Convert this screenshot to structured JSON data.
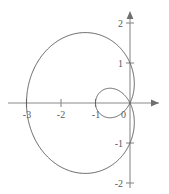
{
  "chart_data": {
    "type": "line",
    "title": "",
    "subtitle": "",
    "xlabel": "",
    "ylabel": "",
    "grid": false,
    "legend": null,
    "axis_style": "arrow-axes-through-origin",
    "xlim": [
      -3.2,
      1.0
    ],
    "ylim": [
      -2.3,
      2.3
    ],
    "xticks": [
      -3,
      -2,
      -1
    ],
    "yticks": [
      2,
      1,
      -1,
      -2
    ],
    "origin_label": "0",
    "xtick_labels": [
      "-3",
      "-2",
      "-1"
    ],
    "ytick_labels": [
      "2",
      "1",
      "-1",
      "-2"
    ],
    "curve": {
      "name": "limacon",
      "equation": "r = 1 - 2 cos(theta)",
      "closed": true,
      "has_inner_loop": true,
      "outer_loop_extent_x": [
        -3.0,
        0.0
      ],
      "outer_loop_extent_y": [
        -1.65,
        1.65
      ],
      "inner_loop_extent_x": [
        -1.0,
        0.0
      ],
      "inner_loop_extent_y": [
        -0.42,
        0.42
      ],
      "points": [
        [
          0.0,
          0.0
        ],
        [
          -0.105,
          0.196
        ],
        [
          -0.378,
          0.345
        ],
        [
          -0.75,
          0.433
        ],
        [
          -1.155,
          0.44
        ],
        [
          -1.55,
          0.36
        ],
        [
          -1.9,
          0.2
        ],
        [
          -2.2,
          -0.02
        ],
        [
          -2.45,
          -0.28
        ],
        [
          -2.64,
          -0.56
        ],
        [
          -2.8,
          -0.86
        ],
        [
          -2.91,
          -1.16
        ],
        [
          -2.97,
          -1.44
        ],
        [
          -2.98,
          -1.6
        ],
        [
          -2.86,
          -1.72
        ],
        [
          -2.6,
          -1.78
        ],
        [
          -2.2,
          -1.74
        ],
        [
          -1.72,
          -1.6
        ],
        [
          -1.2,
          -1.35
        ],
        [
          -0.72,
          -1.04
        ],
        [
          -0.34,
          -0.68
        ],
        [
          -0.1,
          -0.32
        ],
        [
          0.0,
          0.0
        ],
        [
          0.06,
          -0.24
        ],
        [
          -0.02,
          -0.41
        ],
        [
          -0.22,
          -0.5
        ],
        [
          -0.52,
          -0.49
        ],
        [
          -0.79,
          -0.37
        ],
        [
          -0.96,
          -0.17
        ],
        [
          -1.0,
          0.06
        ],
        [
          -0.9,
          0.27
        ],
        [
          -0.68,
          0.41
        ],
        [
          -0.4,
          0.44
        ],
        [
          -0.15,
          0.35
        ],
        [
          -0.02,
          0.18
        ],
        [
          0.0,
          0.0
        ]
      ]
    }
  },
  "labels": {
    "x_neg3": "-3",
    "x_neg2": "-2",
    "x_neg1": "-1",
    "origin": "0",
    "y_pos2": "2",
    "y_pos1": "1",
    "y_neg1": "-1",
    "y_neg2": "-2"
  },
  "colors": {
    "curve": "#5d5d5d",
    "axis": "#8a8a8a",
    "label": "#5a5a5a",
    "background": "#ffffff"
  }
}
